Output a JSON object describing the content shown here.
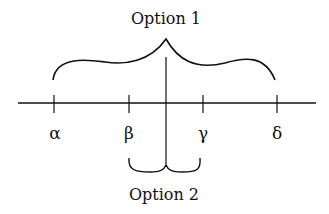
{
  "diagram": {
    "top_label": "Option 1",
    "bottom_label": "Option 2",
    "axis_labels": [
      "α",
      "β",
      "γ",
      "δ"
    ],
    "stroke_color": "#111111",
    "background": "#ffffff"
  }
}
